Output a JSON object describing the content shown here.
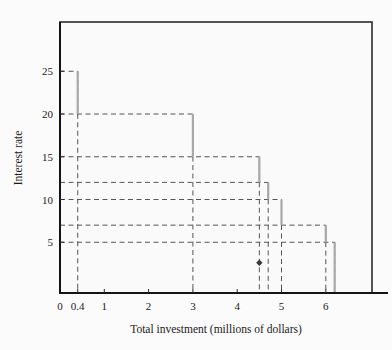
{
  "figure": {
    "background_color": "#fbfbfb",
    "frame_color": "#2b2b2b"
  },
  "chart_data": {
    "type": "line",
    "subtype": "step-function",
    "title": "",
    "xlabel": "Total investment (millions of dollars)",
    "ylabel": "Interest rate",
    "xlim": [
      0,
      7.05
    ],
    "ylim": [
      0,
      31.5
    ],
    "grid": false,
    "legend": null,
    "xticks": [
      0,
      0.4,
      1,
      2,
      3,
      4,
      5,
      6
    ],
    "xtick_labels": [
      "0",
      "0.4",
      "1",
      "2",
      "3",
      "4",
      "5",
      "6"
    ],
    "yticks": [
      5,
      10,
      15,
      20,
      25
    ],
    "ytick_labels": [
      "5",
      "10",
      "15",
      "20",
      "25"
    ],
    "extra_guide_levels": [
      7,
      12
    ],
    "step_color": "#a8a8a8",
    "guide_color": "#555555",
    "steps": [
      {
        "x_start": 0,
        "x_end": 0.4,
        "rate": 25
      },
      {
        "x_start": 0.4,
        "x_end": 3.0,
        "rate": 20
      },
      {
        "x_start": 3.0,
        "x_end": 4.5,
        "rate": 15
      },
      {
        "x_start": 4.5,
        "x_end": 4.7,
        "rate": 12
      },
      {
        "x_start": 4.7,
        "x_end": 5.0,
        "rate": 10
      },
      {
        "x_start": 5.0,
        "x_end": 6.0,
        "rate": 7
      },
      {
        "x_start": 6.0,
        "x_end": 6.2,
        "rate": 5
      }
    ],
    "drop_lines_x": [
      0.4,
      3.0,
      4.5,
      4.7,
      5.0,
      6.0,
      6.2
    ],
    "marker": {
      "x": 4.5,
      "y": 2.6,
      "shape": "diamond",
      "color": "#3a3a3a"
    },
    "annotations": []
  }
}
